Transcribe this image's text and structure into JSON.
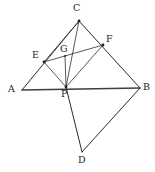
{
  "figure": {
    "kind": "geometry-diagram",
    "background_color": "#ffffff",
    "stroke_color": "#2b2b2b",
    "label_color": "#1b1b1b",
    "points": [
      {
        "id": "A",
        "label": "A",
        "x": 22,
        "y": 90,
        "label_x": 8,
        "label_y": 84
      },
      {
        "id": "B",
        "label": "B",
        "x": 140,
        "y": 88,
        "label_x": 143,
        "label_y": 82
      },
      {
        "id": "C",
        "label": "C",
        "x": 79,
        "y": 21,
        "label_x": 73,
        "label_y": 3
      },
      {
        "id": "D",
        "label": "D",
        "x": 82,
        "y": 152,
        "label_x": 78,
        "label_y": 155
      },
      {
        "id": "E",
        "label": "E",
        "x": 44,
        "y": 62,
        "label_x": 32,
        "label_y": 50
      },
      {
        "id": "F",
        "label": "F",
        "x": 103,
        "y": 45,
        "label_x": 106,
        "label_y": 34
      },
      {
        "id": "G",
        "label": "G",
        "x": 65,
        "y": 56,
        "label_x": 60,
        "label_y": 44
      },
      {
        "id": "P",
        "label": "P",
        "x": 66,
        "y": 87,
        "label_x": 61,
        "label_y": 89
      }
    ],
    "segments": [
      {
        "id": "AC",
        "from": "A",
        "to": "C",
        "style": "seg"
      },
      {
        "id": "CB",
        "from": "C",
        "to": "B",
        "style": "seg"
      },
      {
        "id": "AB",
        "from": "A",
        "to": "B",
        "style": "seg-base"
      },
      {
        "id": "BD",
        "from": "B",
        "to": "D",
        "style": "seg"
      },
      {
        "id": "DP",
        "from": "D",
        "to": "P",
        "style": "seg"
      },
      {
        "id": "PC",
        "from": "P",
        "to": "C",
        "style": "seg-thin"
      },
      {
        "id": "PE",
        "from": "P",
        "to": "E",
        "style": "seg-thin"
      },
      {
        "id": "PF",
        "from": "P",
        "to": "F",
        "style": "seg-thin"
      },
      {
        "id": "PG",
        "from": "P",
        "to": "G",
        "style": "seg-thin"
      },
      {
        "id": "EF",
        "from": "E",
        "to": "F",
        "style": "seg-thin"
      },
      {
        "id": "EC",
        "from": "E",
        "to": "C",
        "style": "seg-thin"
      }
    ],
    "vertex_dots": [
      "C",
      "E",
      "F",
      "P",
      "G"
    ]
  }
}
